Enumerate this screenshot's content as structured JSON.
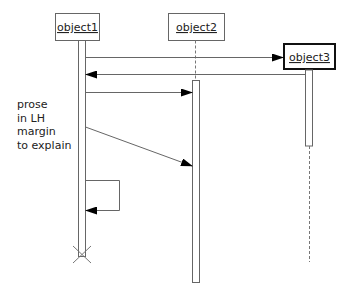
{
  "diagram": {
    "type": "UML sequence diagram",
    "objects": [
      {
        "id": "object1",
        "label": "object1",
        "style": "normal"
      },
      {
        "id": "object2",
        "label": "object2",
        "style": "normal"
      },
      {
        "id": "object3",
        "label": "object3",
        "style": "bold-border"
      }
    ],
    "messages": [
      {
        "from": "object1",
        "to": "object3",
        "kind": "synchronous"
      },
      {
        "from": "object3",
        "to": "object1",
        "kind": "return"
      },
      {
        "from": "object1",
        "to": "object2",
        "kind": "synchronous"
      },
      {
        "from": "object1",
        "to": "object2",
        "kind": "delayed/diagonal"
      },
      {
        "from": "object1",
        "to": "object1",
        "kind": "self-call"
      }
    ],
    "termination": {
      "object": "object1",
      "marker": "X"
    },
    "prose": {
      "lines": [
        "prose",
        "in LH",
        "margin",
        "to explain"
      ]
    },
    "colors": {
      "line": "#555555",
      "arrowhead": "#000000",
      "text": "#222222",
      "background": "#ffffff"
    }
  }
}
